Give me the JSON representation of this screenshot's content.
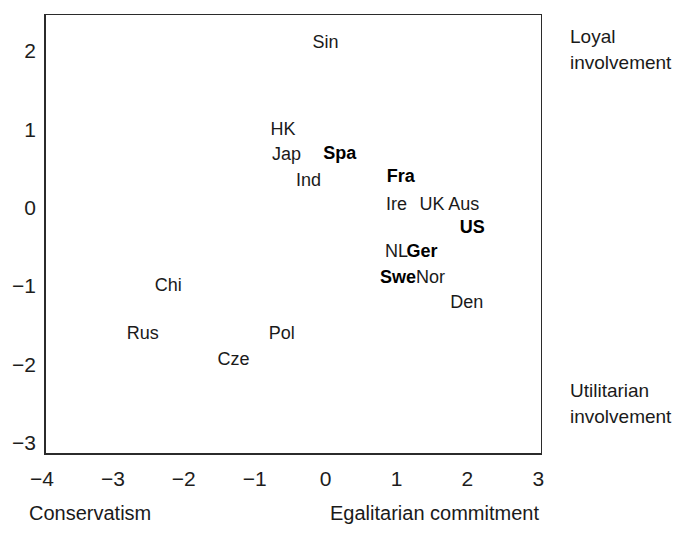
{
  "chart_data": {
    "type": "scatter",
    "title": "",
    "xlabel": "Egalitarian commitment",
    "xlabel_left": "Conservatism",
    "ylabel_top": "Loyal involvement",
    "ylabel_bottom": "Utilitarian involvement",
    "xlim": [
      -4,
      3
    ],
    "ylim": [
      -3,
      2.35
    ],
    "grid": false,
    "legend": "none",
    "xticks": [
      "-4",
      "-3",
      "-2",
      "-1",
      "0",
      "1",
      "2",
      "3"
    ],
    "xtick_values": [
      -4,
      -3,
      -2,
      -1,
      0,
      1,
      2,
      3
    ],
    "yticks": [
      "2",
      "1",
      "0",
      "-1",
      "-2",
      "-3"
    ],
    "ytick_values": [
      2,
      1,
      0,
      -1,
      -2,
      -3
    ],
    "points": [
      {
        "label": "Sin",
        "x": 0.0,
        "y": 2.1,
        "bold": false
      },
      {
        "label": "HK",
        "x": -0.6,
        "y": 1.0,
        "bold": false
      },
      {
        "label": "Jap",
        "x": -0.55,
        "y": 0.67,
        "bold": false
      },
      {
        "label": "Spa",
        "x": 0.2,
        "y": 0.69,
        "bold": true
      },
      {
        "label": "Ind",
        "x": -0.24,
        "y": 0.35,
        "bold": false
      },
      {
        "label": "Fra",
        "x": 1.06,
        "y": 0.4,
        "bold": true
      },
      {
        "label": "Ire",
        "x": 1.0,
        "y": 0.04,
        "bold": false
      },
      {
        "label": "UK",
        "x": 1.5,
        "y": 0.04,
        "bold": false
      },
      {
        "label": "Aus",
        "x": 1.95,
        "y": 0.04,
        "bold": false
      },
      {
        "label": "US",
        "x": 2.07,
        "y": -0.26,
        "bold": true
      },
      {
        "label": "NL",
        "x": 1.0,
        "y": -0.56,
        "bold": false
      },
      {
        "label": "Ger",
        "x": 1.36,
        "y": -0.56,
        "bold": true
      },
      {
        "label": "Swe",
        "x": 1.02,
        "y": -0.89,
        "bold": true
      },
      {
        "label": "Nor",
        "x": 1.48,
        "y": -0.89,
        "bold": false
      },
      {
        "label": "Den",
        "x": 1.99,
        "y": -1.21,
        "bold": false
      },
      {
        "label": "Chi",
        "x": -2.22,
        "y": -1.0,
        "bold": false
      },
      {
        "label": "Rus",
        "x": -2.58,
        "y": -1.61,
        "bold": false
      },
      {
        "label": "Pol",
        "x": -0.62,
        "y": -1.61,
        "bold": false
      },
      {
        "label": "Cze",
        "x": -1.3,
        "y": -1.94,
        "bold": false
      }
    ]
  }
}
